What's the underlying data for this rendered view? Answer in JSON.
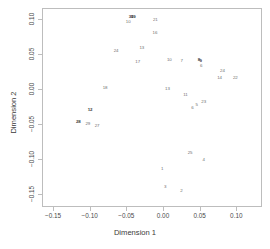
{
  "chart_data": {
    "type": "scatter",
    "title": "",
    "xlabel": "Dimension 1",
    "ylabel": "Dimension 2",
    "xlim": [
      -0.165,
      0.135
    ],
    "ylim": [
      -0.168,
      0.115
    ],
    "xticks": [
      "-0.15",
      "-0.10",
      "-0.05",
      "0.00",
      "0.05",
      "0.10"
    ],
    "xtick_values": [
      -0.15,
      -0.1,
      -0.05,
      0.0,
      0.05,
      0.1
    ],
    "yticks": [
      "0.10",
      "0.05",
      "0.00",
      "-0.05",
      "-0.10",
      "-0.15"
    ],
    "ytick_values": [
      0.1,
      0.05,
      0.0,
      -0.05,
      -0.1,
      -0.15
    ],
    "grid": false,
    "legend": null,
    "marker_style": "text-labels",
    "point_color": "#6e6e6e",
    "highlight_color": "#3a3a3a",
    "frame_color": "#bdbdbd",
    "points": [
      {
        "label": "30",
        "x": -0.0435,
        "y": 0.1015,
        "bold": true
      },
      {
        "label": "19",
        "x": -0.0405,
        "y": 0.102,
        "bold": true
      },
      {
        "label": "10",
        "x": -0.0475,
        "y": 0.0955,
        "bold": false
      },
      {
        "label": "21",
        "x": -0.0105,
        "y": 0.0975,
        "bold": false
      },
      {
        "label": "16",
        "x": -0.011,
        "y": 0.079,
        "bold": false
      },
      {
        "label": "13",
        "x": -0.029,
        "y": 0.0585,
        "bold": false
      },
      {
        "label": "24",
        "x": -0.064,
        "y": 0.0535,
        "bold": false
      },
      {
        "label": "17",
        "x": -0.0345,
        "y": 0.0385,
        "bold": false
      },
      {
        "label": "10",
        "x": 0.0085,
        "y": 0.0405,
        "bold": false
      },
      {
        "label": "7",
        "x": 0.0255,
        "y": 0.04,
        "bold": false
      },
      {
        "label": "8",
        "x": 0.049,
        "y": 0.0405,
        "bold": true
      },
      {
        "label": "9",
        "x": 0.0515,
        "y": 0.0395,
        "bold": true
      },
      {
        "label": "6",
        "x": 0.052,
        "y": 0.033,
        "bold": false
      },
      {
        "label": "24",
        "x": 0.081,
        "y": 0.0255,
        "bold": false
      },
      {
        "label": "14",
        "x": 0.077,
        "y": 0.015,
        "bold": false
      },
      {
        "label": "22",
        "x": 0.0985,
        "y": 0.016,
        "bold": false
      },
      {
        "label": "18",
        "x": -0.079,
        "y": 0.001,
        "bold": false
      },
      {
        "label": "13",
        "x": 0.006,
        "y": 0.0,
        "bold": false
      },
      {
        "label": "11",
        "x": 0.0305,
        "y": -0.009,
        "bold": false
      },
      {
        "label": "23",
        "x": 0.0555,
        "y": -0.019,
        "bold": false
      },
      {
        "label": "5",
        "x": 0.046,
        "y": -0.0225,
        "bold": false
      },
      {
        "label": "6",
        "x": 0.04,
        "y": -0.0265,
        "bold": false
      },
      {
        "label": "12",
        "x": -0.0995,
        "y": -0.0305,
        "bold": true
      },
      {
        "label": "28",
        "x": -0.1155,
        "y": -0.047,
        "bold": true
      },
      {
        "label": "29",
        "x": -0.1025,
        "y": -0.05,
        "bold": false
      },
      {
        "label": "27",
        "x": -0.09,
        "y": -0.0525,
        "bold": false
      },
      {
        "label": "25",
        "x": 0.037,
        "y": -0.0905,
        "bold": false
      },
      {
        "label": "4",
        "x": 0.0555,
        "y": -0.1005,
        "bold": false
      },
      {
        "label": "1",
        "x": -0.001,
        "y": -0.1145,
        "bold": false
      },
      {
        "label": "3",
        "x": 0.003,
        "y": -0.14,
        "bold": false
      },
      {
        "label": "2",
        "x": 0.025,
        "y": -0.145,
        "bold": false
      }
    ]
  }
}
